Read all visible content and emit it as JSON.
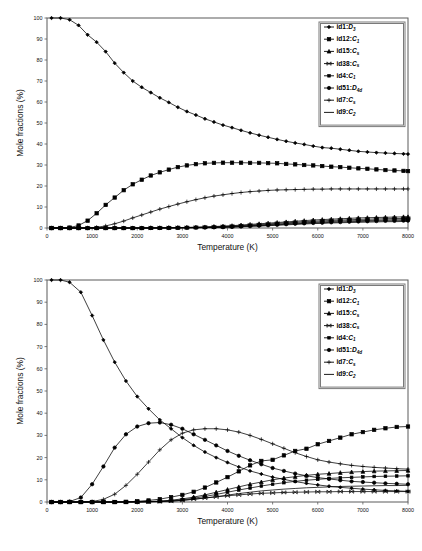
{
  "figure": {
    "panels": [
      "upper",
      "lower"
    ],
    "line_color": "#000000",
    "axis_color": "#5a5a5a",
    "background": "#ffffff"
  },
  "legend": {
    "position": "upper-right",
    "entries": [
      {
        "id": "id1",
        "label": "id1:",
        "symmetry": "D",
        "sub": "3",
        "marker": "diamond"
      },
      {
        "id": "id12",
        "label": "id12:",
        "symmetry": "C",
        "sub": "1",
        "marker": "square-filled"
      },
      {
        "id": "id15",
        "label": "id15:",
        "symmetry": "C",
        "sub": "s",
        "marker": "triangle"
      },
      {
        "id": "id38",
        "label": "id38:",
        "symmetry": "C",
        "sub": "s",
        "marker": "bowtie"
      },
      {
        "id": "id4",
        "label": "id4:",
        "symmetry": "C",
        "sub": "1",
        "marker": "square-small"
      },
      {
        "id": "id51",
        "label": "id51:",
        "symmetry": "D",
        "sub": "4d",
        "marker": "circle"
      },
      {
        "id": "id7",
        "label": "id7:",
        "symmetry": "C",
        "sub": "s",
        "marker": "plus"
      },
      {
        "id": "id9",
        "label": "id9:",
        "symmetry": "C",
        "sub": "2",
        "marker": "line"
      }
    ]
  },
  "chart_data": [
    {
      "panel": "upper",
      "type": "line",
      "title": "",
      "xlabel": "Temperature (K)",
      "ylabel": "Mole fractions (%)",
      "xlim": [
        0,
        8000
      ],
      "ylim": [
        0,
        100
      ],
      "xticks": [
        0,
        1000,
        2000,
        3000,
        4000,
        5000,
        6000,
        7000,
        8000
      ],
      "yticks": [
        0,
        10,
        20,
        30,
        40,
        50,
        60,
        70,
        80,
        90,
        100
      ],
      "grid": false,
      "legend_position": "upper-right",
      "x": [
        100,
        300,
        500,
        700,
        900,
        1100,
        1300,
        1500,
        1700,
        1900,
        2100,
        2300,
        2500,
        2700,
        2900,
        3100,
        3300,
        3500,
        3700,
        3900,
        4100,
        4300,
        4500,
        4700,
        4900,
        5100,
        5300,
        5500,
        5700,
        5900,
        6100,
        6300,
        6500,
        6700,
        6900,
        7100,
        7300,
        7500,
        7700,
        7900,
        8000
      ],
      "series": [
        {
          "name": "id1",
          "marker": "diamond",
          "values": [
            100,
            100,
            99.2,
            96.5,
            92.0,
            88.5,
            84.0,
            78.5,
            74.0,
            70.0,
            67.0,
            64.5,
            62.0,
            59.8,
            57.5,
            55.5,
            53.8,
            52.0,
            50.5,
            49.0,
            47.8,
            46.5,
            45.3,
            44.2,
            43.2,
            42.2,
            41.3,
            40.5,
            39.8,
            39.0,
            38.3,
            38.0,
            37.5,
            37.0,
            36.5,
            36.2,
            35.9,
            35.7,
            35.5,
            35.3,
            35.2
          ]
        },
        {
          "name": "id12",
          "marker": "square-filled",
          "values": [
            0,
            0,
            0.2,
            1.2,
            3.5,
            7.0,
            11.0,
            14.5,
            18.0,
            20.8,
            23.0,
            25.0,
            26.5,
            27.8,
            29.0,
            29.8,
            30.4,
            30.8,
            31.0,
            31.1,
            31.1,
            31.1,
            31.0,
            31.0,
            30.9,
            30.8,
            30.5,
            30.3,
            30.0,
            29.8,
            29.5,
            29.2,
            29.0,
            28.7,
            28.4,
            28.2,
            27.9,
            27.6,
            27.4,
            27.2,
            27.1
          ]
        },
        {
          "name": "id7",
          "marker": "plus",
          "values": [
            0,
            0,
            0,
            0,
            0,
            0.3,
            1.0,
            2.0,
            3.3,
            4.8,
            6.2,
            7.6,
            9.0,
            10.2,
            11.4,
            12.5,
            13.5,
            14.4,
            15.2,
            15.8,
            16.4,
            16.9,
            17.3,
            17.6,
            17.9,
            18.1,
            18.2,
            18.3,
            18.4,
            18.5,
            18.5,
            18.6,
            18.6,
            18.6,
            18.6,
            18.6,
            18.6,
            18.6,
            18.6,
            18.6,
            18.6
          ]
        },
        {
          "name": "id15",
          "marker": "triangle",
          "values": [
            0,
            0,
            0,
            0,
            0,
            0,
            0,
            0,
            0,
            0,
            0,
            0.1,
            0.1,
            0.2,
            0.2,
            0.3,
            0.4,
            0.5,
            0.7,
            0.9,
            1.1,
            1.4,
            1.7,
            2.0,
            2.3,
            2.6,
            2.9,
            3.2,
            3.5,
            3.8,
            4.0,
            4.2,
            4.4,
            4.6,
            4.8,
            4.9,
            5.0,
            5.1,
            5.2,
            5.3,
            5.3
          ]
        },
        {
          "name": "id38",
          "marker": "bowtie",
          "values": [
            0,
            0,
            0,
            0,
            0,
            0,
            0,
            0,
            0,
            0,
            0,
            0,
            0.1,
            0.1,
            0.2,
            0.2,
            0.3,
            0.4,
            0.5,
            0.7,
            0.9,
            1.1,
            1.4,
            1.6,
            1.9,
            2.2,
            2.5,
            2.7,
            3.0,
            3.2,
            3.4,
            3.6,
            3.8,
            3.9,
            4.1,
            4.2,
            4.3,
            4.4,
            4.5,
            4.5,
            4.6
          ]
        },
        {
          "name": "id4",
          "marker": "square-small",
          "values": [
            0,
            0,
            0,
            0,
            0,
            0,
            0,
            0,
            0,
            0,
            0,
            0,
            0,
            0.1,
            0.1,
            0.2,
            0.2,
            0.3,
            0.4,
            0.5,
            0.7,
            0.9,
            1.1,
            1.3,
            1.6,
            1.8,
            2.1,
            2.3,
            2.5,
            2.7,
            2.9,
            3.1,
            3.3,
            3.4,
            3.5,
            3.6,
            3.7,
            3.8,
            3.9,
            3.9,
            4.0
          ]
        },
        {
          "name": "id51",
          "marker": "circle",
          "values": [
            0,
            0,
            0,
            0,
            0,
            0,
            0,
            0,
            0,
            0,
            0,
            0,
            0,
            0,
            0.1,
            0.1,
            0.2,
            0.2,
            0.3,
            0.4,
            0.5,
            0.7,
            0.9,
            1.1,
            1.3,
            1.5,
            1.8,
            2.0,
            2.2,
            2.4,
            2.5,
            2.7,
            2.8,
            3.0,
            3.1,
            3.2,
            3.3,
            3.4,
            3.4,
            3.5,
            3.5
          ]
        },
        {
          "name": "id9",
          "marker": "line",
          "values": [
            0,
            0,
            0,
            0,
            0,
            0,
            0,
            0,
            0,
            0,
            0,
            0,
            0,
            0,
            0,
            0.1,
            0.1,
            0.2,
            0.2,
            0.3,
            0.4,
            0.6,
            0.8,
            0.9,
            1.1,
            1.3,
            1.5,
            1.7,
            1.9,
            2.1,
            2.2,
            2.4,
            2.5,
            2.6,
            2.7,
            2.8,
            2.9,
            3.0,
            3.0,
            3.1,
            3.1
          ]
        }
      ]
    },
    {
      "panel": "lower",
      "type": "line",
      "title": "",
      "xlabel": "Temperature (K)",
      "ylabel": "Mole fractions (%)",
      "xlim": [
        0,
        8000
      ],
      "ylim": [
        0,
        100
      ],
      "xticks": [
        0,
        1000,
        2000,
        3000,
        4000,
        5000,
        6000,
        7000,
        8000
      ],
      "yticks": [
        0,
        10,
        20,
        30,
        40,
        50,
        60,
        70,
        80,
        90,
        100
      ],
      "grid": false,
      "legend_position": "upper-right",
      "x": [
        100,
        300,
        500,
        750,
        1000,
        1250,
        1500,
        1750,
        2000,
        2250,
        2500,
        2750,
        3000,
        3250,
        3500,
        3750,
        4000,
        4250,
        4500,
        4750,
        5000,
        5250,
        5500,
        5750,
        6000,
        6250,
        6500,
        6750,
        7000,
        7250,
        7500,
        7750,
        8000
      ],
      "series": [
        {
          "name": "id1",
          "marker": "diamond",
          "values": [
            100,
            100,
            99.0,
            94.5,
            84.0,
            73.0,
            63.0,
            54.5,
            47.5,
            42.0,
            37.0,
            33.0,
            29.0,
            25.5,
            22.5,
            20.0,
            17.8,
            15.8,
            14.0,
            12.6,
            11.2,
            10.2,
            9.2,
            8.4,
            7.7,
            7.1,
            6.6,
            6.2,
            5.8,
            5.5,
            5.2,
            5.0,
            4.8
          ]
        },
        {
          "name": "id51",
          "marker": "circle",
          "values": [
            0,
            0,
            0.2,
            2.0,
            8.0,
            16.0,
            24.5,
            30.5,
            34.0,
            35.5,
            35.8,
            34.8,
            33.0,
            30.5,
            28.0,
            25.5,
            23.0,
            20.8,
            18.8,
            17.0,
            15.3,
            14.0,
            12.8,
            11.8,
            11.0,
            10.4,
            9.8,
            9.3,
            9.0,
            8.7,
            8.4,
            8.2,
            8.0
          ]
        },
        {
          "name": "id7",
          "marker": "plus",
          "values": [
            0,
            0,
            0,
            0,
            0.2,
            1.2,
            3.5,
            7.5,
            12.5,
            18.0,
            23.5,
            28.0,
            31.0,
            32.5,
            33.0,
            33.0,
            32.5,
            31.5,
            30.0,
            28.2,
            26.2,
            24.2,
            22.2,
            20.5,
            19.0,
            18.0,
            17.2,
            16.5,
            16.0,
            15.6,
            15.3,
            15.0,
            14.8
          ]
        },
        {
          "name": "id12",
          "marker": "square-filled",
          "values": [
            0,
            0,
            0,
            0,
            0,
            0,
            0,
            0.1,
            0.3,
            0.7,
            1.3,
            2.2,
            3.2,
            4.6,
            6.5,
            8.8,
            11.2,
            13.8,
            16.5,
            18.5,
            19.0,
            21.0,
            23.0,
            24.0,
            26.0,
            27.5,
            29.0,
            30.5,
            31.5,
            32.5,
            33.2,
            33.8,
            34.0
          ]
        },
        {
          "name": "id15",
          "marker": "triangle",
          "values": [
            0,
            0,
            0,
            0,
            0,
            0,
            0,
            0,
            0.1,
            0.2,
            0.4,
            0.8,
            1.4,
            2.2,
            3.2,
            4.4,
            5.6,
            6.8,
            8.0,
            9.0,
            10.0,
            10.8,
            11.4,
            12.0,
            12.5,
            12.8,
            13.2,
            13.5,
            13.7,
            13.9,
            14.0,
            14.1,
            14.2
          ]
        },
        {
          "name": "id4",
          "marker": "square-small",
          "values": [
            0,
            0,
            0,
            0,
            0,
            0,
            0,
            0,
            0.1,
            0.2,
            0.3,
            0.6,
            1.0,
            1.7,
            2.5,
            3.4,
            4.4,
            5.4,
            6.3,
            7.2,
            8.0,
            8.7,
            9.3,
            9.8,
            10.2,
            10.6,
            10.9,
            11.1,
            11.3,
            11.5,
            11.6,
            11.7,
            11.8
          ]
        },
        {
          "name": "id9",
          "marker": "line",
          "values": [
            0,
            0,
            0,
            0,
            0,
            0,
            0,
            0,
            0,
            0.1,
            0.2,
            0.4,
            0.7,
            1.2,
            1.8,
            2.4,
            3.1,
            3.8,
            4.4,
            5.0,
            5.4,
            5.8,
            6.1,
            6.4,
            6.6,
            6.8,
            7.0,
            7.1,
            7.2,
            7.3,
            7.4,
            7.4,
            7.5
          ]
        },
        {
          "name": "id38",
          "marker": "bowtie",
          "values": [
            0,
            0,
            0,
            0,
            0,
            0,
            0,
            0,
            0,
            0.1,
            0.2,
            0.4,
            0.8,
            1.3,
            1.8,
            2.3,
            2.8,
            3.2,
            3.6,
            3.9,
            4.1,
            4.3,
            4.4,
            4.5,
            4.6,
            4.6,
            4.7,
            4.7,
            4.7,
            4.7,
            4.7,
            4.7,
            4.7
          ]
        }
      ]
    }
  ]
}
